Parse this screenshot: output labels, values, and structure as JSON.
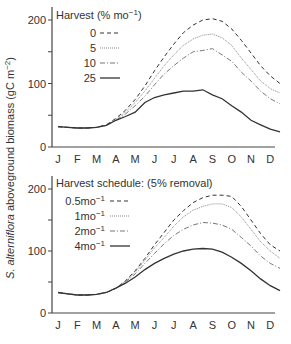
{
  "ylabel": {
    "italic": "S. alterniflora",
    "rest": " aboveground biomass (gC m",
    "sup": "−2",
    "close": ")"
  },
  "months": [
    "J",
    "F",
    "M",
    "A",
    "M",
    "J",
    "J",
    "A",
    "S",
    "O",
    "N",
    "D"
  ],
  "yticks": [
    "0",
    "100",
    "200"
  ],
  "panels": [
    {
      "legend_title": "Harvest (% mo",
      "legend_title_sup": "−1",
      "legend_title_close": ")",
      "legend": [
        {
          "label": "0",
          "sup": "",
          "dash": "4,3",
          "color": "#333333"
        },
        {
          "label": "5",
          "sup": "",
          "dash": "1,1",
          "color": "#8a8a8a"
        },
        {
          "label": "10",
          "sup": "",
          "dash": "5,2,1,2",
          "color": "#777777"
        },
        {
          "label": "25",
          "sup": "",
          "dash": "",
          "color": "#333333"
        }
      ]
    },
    {
      "legend_title": "Harvest schedule: (5% removal)",
      "legend_title_sup": "",
      "legend_title_close": "",
      "legend": [
        {
          "label": "0.5mo",
          "sup": "−1",
          "dash": "4,3",
          "color": "#333333"
        },
        {
          "label": "1mo",
          "sup": "−1",
          "dash": "1,1",
          "color": "#8a8a8a"
        },
        {
          "label": "2mo",
          "sup": "−1",
          "dash": "5,2,1,2",
          "color": "#777777"
        },
        {
          "label": "4mo",
          "sup": "−1",
          "dash": "",
          "color": "#333333"
        }
      ]
    }
  ],
  "chart_data": [
    {
      "type": "line",
      "title": "Harvest (% mo−1)",
      "xlabel": "",
      "ylabel": "S. alterniflora aboveground biomass (gC m−2)",
      "ylim": [
        0,
        220
      ],
      "yticks": [
        0,
        50,
        100,
        150,
        200
      ],
      "categories": [
        "J",
        "F",
        "M",
        "A",
        "M",
        "J",
        "J",
        "A",
        "S",
        "O",
        "N",
        "D"
      ],
      "x": [
        0,
        0.5,
        1,
        1.5,
        2,
        2.5,
        3,
        3.5,
        4,
        4.5,
        5,
        5.5,
        6,
        6.5,
        7,
        7.5,
        8,
        8.5,
        9,
        9.5,
        10,
        10.5,
        11,
        11.5
      ],
      "series": [
        {
          "name": "0",
          "values": [
            32,
            31,
            30,
            30,
            31,
            35,
            45,
            58,
            75,
            96,
            120,
            142,
            162,
            180,
            192,
            200,
            202,
            198,
            186,
            168,
            148,
            128,
            112,
            100
          ]
        },
        {
          "name": "5",
          "values": [
            32,
            31,
            30,
            30,
            31,
            34,
            43,
            55,
            70,
            88,
            108,
            128,
            145,
            160,
            170,
            176,
            178,
            172,
            160,
            140,
            122,
            104,
            92,
            85
          ]
        },
        {
          "name": "10",
          "values": [
            32,
            31,
            30,
            30,
            31,
            34,
            42,
            52,
            65,
            80,
            98,
            115,
            128,
            140,
            150,
            152,
            155,
            145,
            135,
            118,
            104,
            88,
            76,
            68
          ]
        },
        {
          "name": "25",
          "values": [
            32,
            31,
            30,
            30,
            31,
            34,
            42,
            48,
            55,
            70,
            78,
            82,
            85,
            88,
            88,
            90,
            82,
            76,
            65,
            55,
            42,
            35,
            28,
            24
          ]
        }
      ]
    },
    {
      "type": "line",
      "title": "Harvest schedule: (5% removal)",
      "xlabel": "",
      "ylabel": "S. alterniflora aboveground biomass (gC m−2)",
      "ylim": [
        0,
        220
      ],
      "yticks": [
        0,
        50,
        100,
        150,
        200
      ],
      "categories": [
        "J",
        "F",
        "M",
        "A",
        "M",
        "J",
        "J",
        "A",
        "S",
        "O",
        "N",
        "D"
      ],
      "x": [
        0,
        0.5,
        1,
        1.5,
        2,
        2.5,
        3,
        3.5,
        4,
        4.5,
        5,
        5.5,
        6,
        6.5,
        7,
        7.5,
        8,
        8.5,
        9,
        9.5,
        10,
        10.5,
        11,
        11.5
      ],
      "series": [
        {
          "name": "0.5mo−1",
          "values": [
            33,
            31,
            29,
            29,
            30,
            33,
            40,
            52,
            68,
            88,
            110,
            130,
            150,
            165,
            178,
            186,
            190,
            190,
            188,
            172,
            150,
            128,
            110,
            100
          ]
        },
        {
          "name": "1mo−1",
          "values": [
            33,
            31,
            29,
            29,
            30,
            33,
            40,
            51,
            66,
            85,
            105,
            122,
            140,
            155,
            166,
            172,
            176,
            176,
            170,
            155,
            135,
            115,
            100,
            88
          ]
        },
        {
          "name": "2mo−1",
          "values": [
            33,
            31,
            29,
            29,
            30,
            33,
            40,
            50,
            63,
            80,
            96,
            112,
            125,
            135,
            142,
            146,
            145,
            142,
            135,
            122,
            108,
            92,
            80,
            72
          ]
        },
        {
          "name": "4mo−1",
          "values": [
            33,
            31,
            29,
            29,
            30,
            33,
            40,
            48,
            58,
            70,
            80,
            88,
            95,
            100,
            103,
            104,
            103,
            98,
            90,
            80,
            68,
            55,
            44,
            36
          ]
        }
      ]
    }
  ]
}
